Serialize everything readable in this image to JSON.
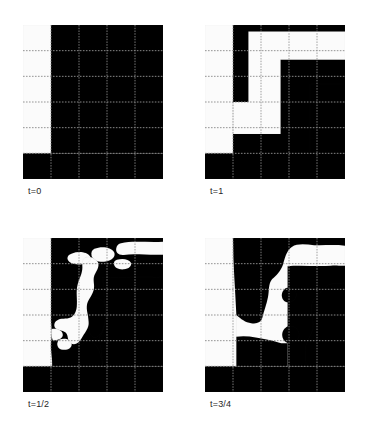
{
  "figure": {
    "title": "",
    "background": "#ffffff",
    "width": 367,
    "height": 429
  },
  "palette": {
    "white_phase": "#fbfbfb",
    "light_gray_phase": "#b6b6b6",
    "dark_gray_phase": "#8b8b8b",
    "grid_line": "#8f8f8f",
    "interface_line": "#3a3a3a",
    "frame_line": "#6f6f6f",
    "label_text": "#262626"
  },
  "grid": {
    "columns": 5,
    "rows": 6,
    "style": "dotted",
    "visible": true
  },
  "panels": [
    {
      "id": "panel-t0",
      "label": "t=0",
      "position": {
        "x": 23,
        "y": 25,
        "width": 140,
        "height": 154
      },
      "description": "Initial condition: vertical interface at x=1/5 separating white phase (left) from dark gray phase (right); horizontal interface near bottom with light gray band below.",
      "regions": [
        {
          "phase": "white",
          "color": "#fbfbfb"
        },
        {
          "phase": "dark_gray",
          "color": "#8b8b8b"
        },
        {
          "phase": "light_gray",
          "color": "#b6b6b6"
        }
      ]
    },
    {
      "id": "panel-t1",
      "label": "t=1",
      "position": {
        "x": 205,
        "y": 25,
        "width": 140,
        "height": 154
      },
      "description": "Final state: rectilinear polygonal interfaces; dark gray column, white lobe, light gray lower-right block and a dark gray vertical bar on the right.",
      "regions": [
        {
          "phase": "white",
          "color": "#fbfbfb"
        },
        {
          "phase": "dark_gray",
          "color": "#8b8b8b"
        },
        {
          "phase": "light_gray",
          "color": "#b6b6b6"
        }
      ]
    },
    {
      "id": "panel-thalf",
      "label": "t=1/2",
      "position": {
        "x": 23,
        "y": 238,
        "width": 140,
        "height": 154
      },
      "description": "Intermediate state at half time: curved, irregular interfaces with white filaments and isolated white droplets inside the dark gray phase.",
      "regions": [
        {
          "phase": "white",
          "color": "#fbfbfb"
        },
        {
          "phase": "dark_gray",
          "color": "#8b8b8b"
        },
        {
          "phase": "light_gray",
          "color": "#b6b6b6"
        }
      ]
    },
    {
      "id": "panel-t34",
      "label": "t=3/4",
      "position": {
        "x": 205,
        "y": 238,
        "width": 140,
        "height": 154
      },
      "description": "Intermediate state at three-quarter time: smoother curved interfaces, a large white channel and two small dark gray droplets along the interface.",
      "regions": [
        {
          "phase": "white",
          "color": "#fbfbfb"
        },
        {
          "phase": "dark_gray",
          "color": "#8b8b8b"
        },
        {
          "phase": "light_gray",
          "color": "#b6b6b6"
        }
      ]
    }
  ]
}
